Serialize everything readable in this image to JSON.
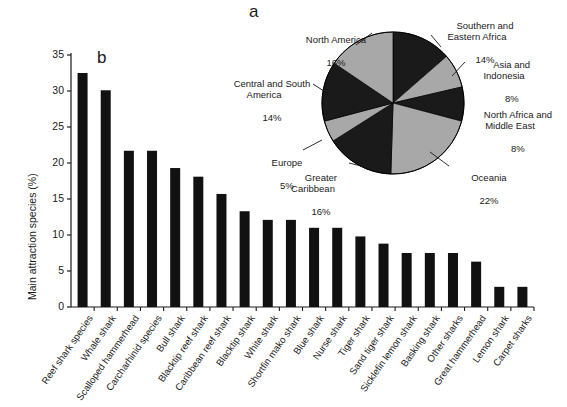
{
  "figure": {
    "panel_a_letter": "a",
    "panel_b_letter": "b"
  },
  "chart_data": [
    {
      "type": "pie",
      "panel": "a",
      "title": "",
      "legend_position": "callout-labels",
      "start_angle_deg": 0,
      "direction": "clockwise",
      "colors": [
        "#1a1a1a",
        "#a8a8a8"
      ],
      "labels": [
        "Southern and\nEastern Africa",
        "Asia and\nIndonesia",
        "North Africa and\nMiddle East",
        "Oceania",
        "Greater\nCaribbean",
        "Europe",
        "Central and South\nAmerica",
        "North America"
      ],
      "values": [
        14,
        8,
        8,
        22,
        16,
        5,
        14,
        16
      ],
      "value_labels": [
        "14%",
        "8%",
        "8%",
        "22%",
        "16%",
        "5%",
        "14%",
        "16%"
      ],
      "slices": [
        {
          "label": "Southern and Eastern Africa",
          "value": 14,
          "value_label": "14%",
          "color": "#1a1a1a"
        },
        {
          "label": "Asia and Indonesia",
          "value": 8,
          "value_label": "8%",
          "color": "#a8a8a8"
        },
        {
          "label": "North Africa and Middle East",
          "value": 8,
          "value_label": "8%",
          "color": "#1a1a1a"
        },
        {
          "label": "Oceania",
          "value": 22,
          "value_label": "22%",
          "color": "#a8a8a8"
        },
        {
          "label": "Greater Caribbean",
          "value": 16,
          "value_label": "16%",
          "color": "#1a1a1a"
        },
        {
          "label": "Europe",
          "value": 5,
          "value_label": "5%",
          "color": "#a8a8a8"
        },
        {
          "label": "Central and South America",
          "value": 14,
          "value_label": "14%",
          "color": "#1a1a1a"
        },
        {
          "label": "North America",
          "value": 16,
          "value_label": "16%",
          "color": "#a8a8a8"
        }
      ]
    },
    {
      "type": "bar",
      "panel": "b",
      "title": "",
      "xlabel": "",
      "ylabel": "Main attraction species (%)",
      "ylim": [
        0,
        35
      ],
      "yticks": [
        0,
        5,
        10,
        15,
        20,
        25,
        30,
        35
      ],
      "ytick_labels": [
        "0",
        "5",
        "10",
        "15",
        "20",
        "25",
        "30",
        "35"
      ],
      "grid": false,
      "bar_color": "#111111",
      "categories": [
        "Reef shark species",
        "Whale shark",
        "Scalloped hammerhead",
        "Carcharhinid species",
        "Bull shark",
        "Blacktip reef shark",
        "Caribbean reef shark",
        "Blacktip shark",
        "White shark",
        "Shortfin mako shark",
        "Blue shark",
        "Nurse shark",
        "Tiger shark",
        "Sand tiger shark",
        "Sicklefin lemon shark",
        "Basking shark",
        "Other sharks",
        "Great hammerhead",
        "Lemon shark",
        "Carpet sharks"
      ],
      "values": [
        32.5,
        30.1,
        21.7,
        21.7,
        19.3,
        18.1,
        15.7,
        13.3,
        12.1,
        12.1,
        11.0,
        11.0,
        9.8,
        8.8,
        7.5,
        7.5,
        7.5,
        6.3,
        2.8,
        2.8
      ]
    }
  ]
}
